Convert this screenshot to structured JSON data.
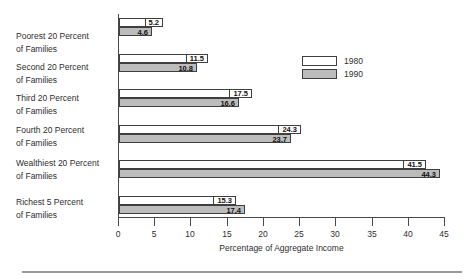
{
  "chart_data": {
    "type": "bar",
    "orientation": "horizontal",
    "title": "",
    "categories": [
      {
        "line1": "Poorest 20 Percent",
        "line2": "of Families"
      },
      {
        "line1": "Second 20 Percent",
        "line2": "of Families"
      },
      {
        "line1": "Third 20 Percent",
        "line2": "of Families"
      },
      {
        "line1": "Fourth 20 Percent",
        "line2": "of Families"
      },
      {
        "line1": "Wealthiest 20 Percent",
        "line2": "of Families"
      },
      {
        "line1": "Richest 5 Percent",
        "line2": "of Families"
      }
    ],
    "series": [
      {
        "name": "1980",
        "color": "#ffffff",
        "values": [
          5.2,
          11.5,
          17.5,
          24.3,
          41.5,
          15.3
        ]
      },
      {
        "name": "1990",
        "color": "#bcbcbc",
        "values": [
          4.6,
          10.8,
          16.6,
          23.7,
          44.3,
          17.4
        ]
      }
    ],
    "xlabel": "Percentage of Aggregate Income",
    "xlim": [
      0,
      45
    ],
    "xticks": [
      0,
      5,
      10,
      15,
      20,
      25,
      30,
      35,
      40,
      45
    ],
    "grid": false,
    "value_labels": true,
    "legend_position": "upper-right"
  },
  "colors": {
    "bar_1980_fill": "#ffffff",
    "bar_1990_fill": "#bcbcbc",
    "bar_border": "#3f3f3f",
    "axis": "#4a4a4a",
    "text": "#2e2e2e",
    "divider": "#9a9a9a"
  }
}
